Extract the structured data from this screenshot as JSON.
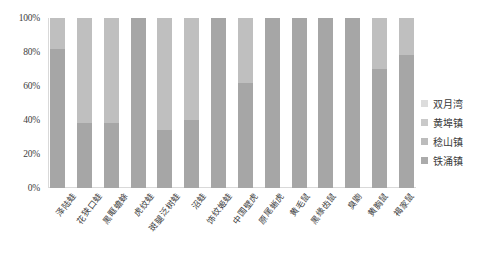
{
  "chart_data": {
    "type": "bar",
    "stacked": true,
    "normalized": true,
    "title": "",
    "xlabel": "",
    "ylabel": "",
    "ylim": [
      0,
      100
    ],
    "ytick_labels": [
      "0%",
      "20%",
      "40%",
      "60%",
      "80%",
      "100%"
    ],
    "ytick_values": [
      0,
      20,
      40,
      60,
      80,
      100
    ],
    "grid": false,
    "legend_position": "right",
    "categories": [
      "泽陆蛙",
      "花狭口蛙",
      "黑眶蟾蜍",
      "虎纹蛙",
      "斑腿泛树蛙",
      "沼蛙",
      "饰纹姬蛙",
      "中国壁虎",
      "原尾蜥虎",
      "黄毛鼠",
      "黑缘齿鼠",
      "臭鼩",
      "黄胸鼠",
      "褐家鼠"
    ],
    "series": [
      {
        "name": "铁涌镇",
        "color": "#a6a6a6",
        "values": [
          82,
          38,
          38,
          100,
          34,
          40,
          100,
          62,
          100,
          100,
          100,
          100,
          70,
          78
        ]
      },
      {
        "name": "稔山镇",
        "color": "#bfbfbf",
        "values": [
          18,
          62,
          62,
          0,
          66,
          60,
          0,
          38,
          0,
          0,
          0,
          0,
          30,
          22
        ]
      },
      {
        "name": "黄埠镇",
        "color": "#d0d0d0",
        "values": [
          0,
          0,
          0,
          0,
          0,
          0,
          0,
          0,
          0,
          0,
          0,
          0,
          0,
          0
        ]
      },
      {
        "name": "双月湾",
        "color": "#e2e2e2",
        "values": [
          0,
          0,
          0,
          0,
          0,
          0,
          0,
          0,
          0,
          0,
          0,
          0,
          0,
          0
        ]
      }
    ]
  },
  "legend": {
    "items": [
      {
        "label": "双月湾",
        "color": "#dcdcdc"
      },
      {
        "label": "黄埠镇",
        "color": "#c9c9c9"
      },
      {
        "label": "稔山镇",
        "color": "#bcbcbc"
      },
      {
        "label": "铁涌镇",
        "color": "#ababab"
      }
    ]
  },
  "axis": {
    "y_ticks": [
      "100%",
      "80%",
      "60%",
      "40%",
      "20%",
      "0%"
    ]
  }
}
